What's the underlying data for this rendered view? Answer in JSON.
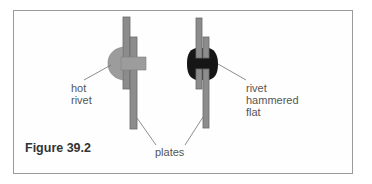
{
  "figure": {
    "caption": "Figure 39.2",
    "labels": {
      "hot_rivet": [
        "hot",
        "rivet"
      ],
      "rivet_hammered_flat": [
        "rivet",
        "hammered",
        "flat"
      ],
      "plates": "plates"
    },
    "colors": {
      "plate": "#8a8a8a",
      "plate_edge": "#666666",
      "hot_rivet": "#9a9a9a",
      "hammered_rivet": "#161616",
      "leader_line": "#707070",
      "frame": "#9a9a9a"
    }
  }
}
